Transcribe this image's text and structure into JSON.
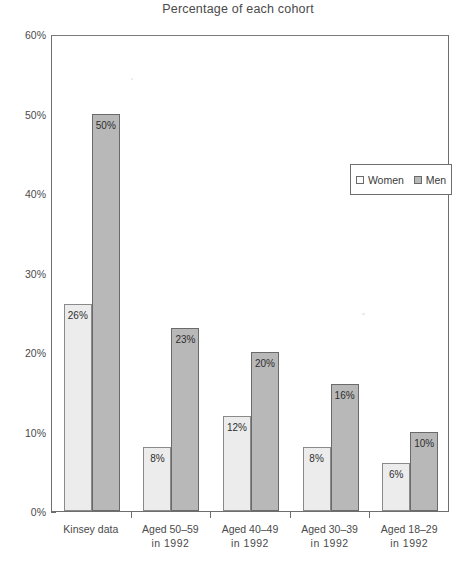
{
  "chart_data": {
    "type": "bar",
    "title": "Percentage of each cohort",
    "title_ghost": "of men and women reporting same-sex partners",
    "xlabel": "",
    "ylabel": "",
    "ylim": [
      0,
      60
    ],
    "ytick_labels": [
      "0%",
      "10%",
      "20%",
      "30%",
      "40%",
      "50%",
      "60%"
    ],
    "ytick_values": [
      0,
      10,
      20,
      30,
      40,
      50,
      60
    ],
    "grid": false,
    "legend_position": "upper right inside plot",
    "categories": [
      {
        "line1": "Kinsey data",
        "line2": ""
      },
      {
        "line1": "Aged 50–59",
        "line2": "in 1992"
      },
      {
        "line1": "Aged 40–49",
        "line2": "in 1992"
      },
      {
        "line1": "Aged 30–39",
        "line2": "in 1992"
      },
      {
        "line1": "Aged 18–29",
        "line2": "in 1992"
      }
    ],
    "series": [
      {
        "name": "Women",
        "color": "#ececec",
        "values": [
          26,
          8,
          12,
          8,
          6
        ],
        "labels": [
          "26%",
          "8%",
          "12%",
          "8%",
          "6%"
        ]
      },
      {
        "name": "Men",
        "color": "#b8b8b8",
        "values": [
          50,
          23,
          20,
          16,
          10
        ],
        "labels": [
          "50%",
          "23%",
          "20%",
          "16%",
          "10%"
        ]
      }
    ]
  },
  "legend": {
    "items": [
      {
        "label": "Women",
        "swatch": "women"
      },
      {
        "label": "Men",
        "swatch": "men"
      }
    ]
  }
}
